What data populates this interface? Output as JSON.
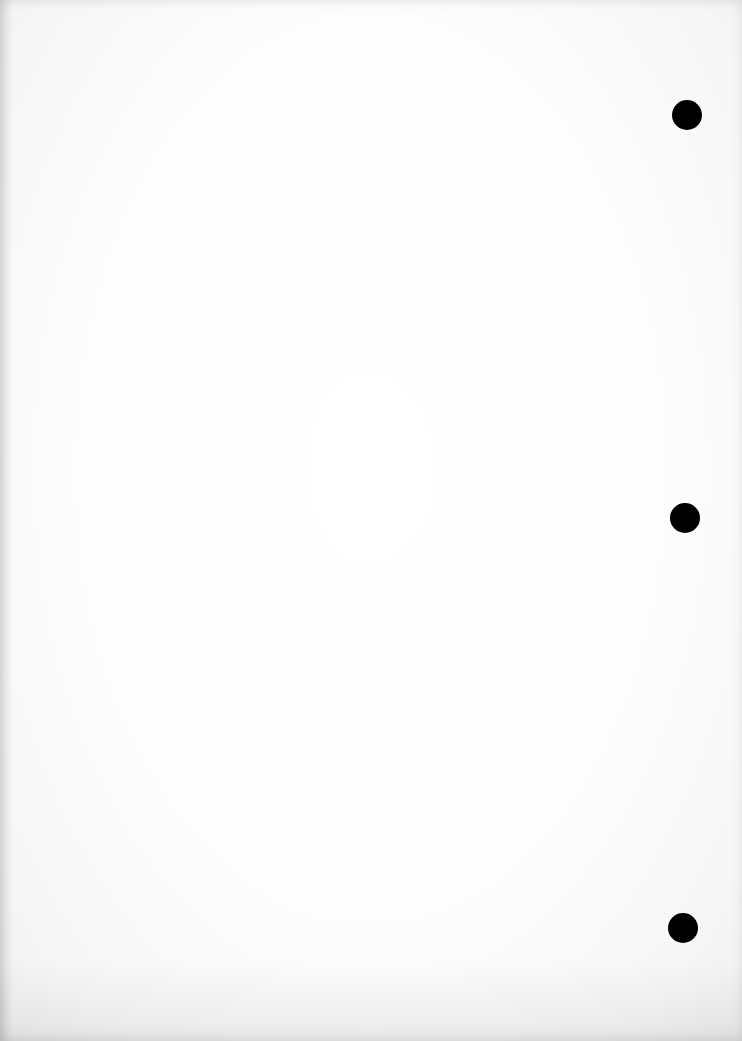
{
  "page": {
    "type": "blank-paper-sheet",
    "background_color": "#ffffff",
    "punch_holes": [
      {
        "position": "top",
        "cx": 687,
        "cy": 115,
        "color": "#000000"
      },
      {
        "position": "middle",
        "cx": 685,
        "cy": 518,
        "color": "#000000"
      },
      {
        "position": "bottom",
        "cx": 683,
        "cy": 928,
        "color": "#000000"
      }
    ]
  }
}
